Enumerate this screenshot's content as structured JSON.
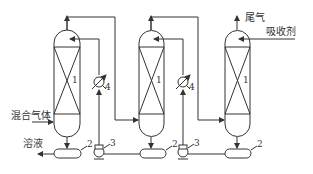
{
  "diagram": {
    "type": "process-flow",
    "labels": {
      "mixed_gas": "混合气体",
      "solution": "溶液",
      "tail_gas": "尾气",
      "absorbent": "吸收剂"
    },
    "component_numbers": {
      "column": "1",
      "tank": "2",
      "pump": "3",
      "cooler": "4"
    },
    "legend": [
      {
        "number": "1",
        "meaning": "absorption column"
      },
      {
        "number": "2",
        "meaning": "tank"
      },
      {
        "number": "3",
        "meaning": "pump"
      },
      {
        "number": "4",
        "meaning": "cooler"
      }
    ],
    "stroke_color": "#333333"
  }
}
